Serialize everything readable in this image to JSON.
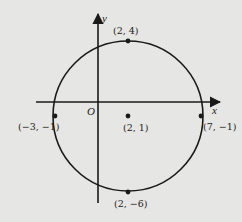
{
  "diagram": {
    "type": "circle-on-coordinate-plane",
    "axes": {
      "x_label": "x",
      "y_label": "y",
      "origin_label": "O"
    },
    "circle": {
      "center": "(2, 1)",
      "radius": 5
    },
    "points": [
      {
        "label": "(2, 4)",
        "role": "top"
      },
      {
        "label": "(-3, -1)",
        "role": "left"
      },
      {
        "label": "(2, 1)",
        "role": "center"
      },
      {
        "label": "(7, -1)",
        "role": "right"
      },
      {
        "label": "(2, -6)",
        "role": "bottom"
      }
    ],
    "colors": {
      "background": "#e6e6e4",
      "stroke": "#1a1a1a"
    }
  },
  "labels": {
    "top": "(2, 4)",
    "left": "(−3, −1)",
    "center": "(2, 1)",
    "right": "(7, −1)",
    "bottom": "(2, −6)",
    "x": "x",
    "y": "y",
    "origin": "O"
  }
}
